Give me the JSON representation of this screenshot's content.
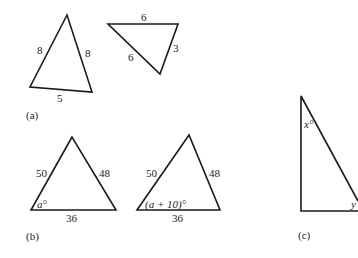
{
  "figure": {
    "panel_a": {
      "label": "(a)",
      "triangle_1": {
        "side_left": "8",
        "side_right": "8",
        "side_bottom": "5"
      },
      "triangle_2": {
        "side_top": "6",
        "side_left": "6",
        "side_right": "3"
      }
    },
    "panel_b": {
      "label": "(b)",
      "triangle_1": {
        "side_left": "50",
        "side_right": "48",
        "side_bottom": "36",
        "angle": "a°"
      },
      "triangle_2": {
        "side_left": "50",
        "side_right": "48",
        "side_bottom": "36",
        "angle": "(a + 10)°"
      }
    },
    "panel_c": {
      "label": "(c)",
      "triangle": {
        "angle_top": "x°",
        "angle_bottom": "y"
      }
    }
  }
}
